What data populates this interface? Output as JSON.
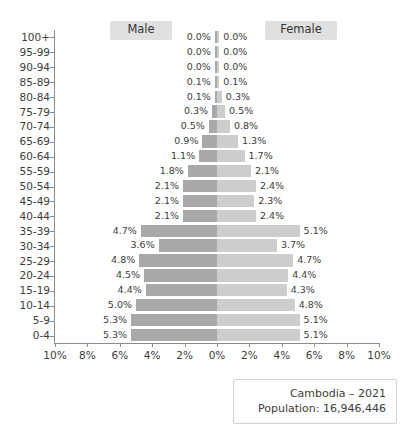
{
  "legend": {
    "male_label": "Male",
    "female_label": "Female"
  },
  "caption": {
    "title": "Cambodia – 2021",
    "population": "Population: 16,946,446"
  },
  "axis": {
    "x_ticks": [
      "10%",
      "8%",
      "6%",
      "4%",
      "2%",
      "0%",
      "2%",
      "4%",
      "6%",
      "8%",
      "10%"
    ],
    "x_tick_values": [
      -10,
      -8,
      -6,
      -4,
      -2,
      0,
      2,
      4,
      6,
      8,
      10
    ]
  },
  "colors": {
    "male_bar": "#a9a9a9",
    "female_bar": "#cdcdcd",
    "legend_pill": "#e0e0e0",
    "axis_line": "#8c8c8c",
    "text": "#3c3c3c",
    "background": "#ffffff",
    "caption_border": "#d2d2d2"
  },
  "chart_data": {
    "type": "bar",
    "subtype": "population-pyramid",
    "title": "Cambodia – 2021",
    "subtitle": "Population: 16,946,446",
    "xlabel": "",
    "ylabel": "",
    "xlim": [
      -10,
      10
    ],
    "grid": false,
    "legend_position": "top",
    "orientation": "horizontal",
    "value_suffix": "%",
    "categories": [
      "100+",
      "95-99",
      "90-94",
      "85-89",
      "80-84",
      "75-79",
      "70-74",
      "65-69",
      "60-64",
      "55-59",
      "50-54",
      "45-49",
      "40-44",
      "35-39",
      "30-34",
      "25-29",
      "20-24",
      "15-19",
      "10-14",
      "5-9",
      "0-4"
    ],
    "series": [
      {
        "name": "Male",
        "color": "#a9a9a9",
        "side": "left",
        "values": [
          0.0,
          0.0,
          0.0,
          0.1,
          0.1,
          0.3,
          0.5,
          0.9,
          1.1,
          1.8,
          2.1,
          2.1,
          2.1,
          4.7,
          3.6,
          4.8,
          4.5,
          4.4,
          5.0,
          5.3,
          5.3
        ],
        "labels": [
          "0.0%",
          "0.0%",
          "0.0%",
          "0.1%",
          "0.1%",
          "0.3%",
          "0.5%",
          "0.9%",
          "1.1%",
          "1.8%",
          "2.1%",
          "2.1%",
          "2.1%",
          "4.7%",
          "3.6%",
          "4.8%",
          "4.5%",
          "4.4%",
          "5.0%",
          "5.3%",
          "5.3%"
        ]
      },
      {
        "name": "Female",
        "color": "#cdcdcd",
        "side": "right",
        "values": [
          0.0,
          0.0,
          0.0,
          0.1,
          0.3,
          0.5,
          0.8,
          1.3,
          1.7,
          2.1,
          2.4,
          2.3,
          2.4,
          5.1,
          3.7,
          4.7,
          4.4,
          4.3,
          4.8,
          5.1,
          5.1
        ],
        "labels": [
          "0.0%",
          "0.0%",
          "0.0%",
          "0.1%",
          "0.3%",
          "0.5%",
          "0.8%",
          "1.3%",
          "1.7%",
          "2.1%",
          "2.4%",
          "2.3%",
          "2.4%",
          "5.1%",
          "3.7%",
          "4.7%",
          "4.4%",
          "4.3%",
          "4.8%",
          "5.1%",
          "5.1%"
        ]
      }
    ]
  }
}
